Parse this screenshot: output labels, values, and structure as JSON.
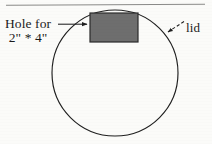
{
  "figure": {
    "background_color": "#fbfbf9",
    "ink_color": "#1b1b1b"
  },
  "top_rule": {
    "name": "horizontal-rule",
    "x1": 6,
    "y1": 5,
    "x2": 205,
    "y2": 4,
    "color": "#8a8a88"
  },
  "lid": {
    "shape": "circle",
    "label": "lid",
    "center_x": 115,
    "center_y": 73,
    "radius": 63,
    "stroke_color": "#1f1f1f",
    "stroke_width": 1.1,
    "fill": "none"
  },
  "hole": {
    "shape": "rectangle",
    "label_line_1": "Hole for",
    "label_line_2": "2\" * 4\"",
    "x": 90,
    "y": 13,
    "width": 48,
    "height": 29,
    "fill_color": "#6e6e6e",
    "stroke_color": "#2a2a2a",
    "stroke_width": 1.2
  },
  "hole_leader": {
    "name": "hole-leader-arrow",
    "x1": 58,
    "y1": 24,
    "x2": 88,
    "y2": 24,
    "color": "#1f1f1f",
    "arrowhead": "filled-triangle"
  },
  "lid_leader": {
    "name": "lid-leader-arrow",
    "x1": 183,
    "y1": 22,
    "x2": 167,
    "y2": 33,
    "color": "#1f1f1f",
    "arrowhead": "filled-triangle",
    "style": "dashed"
  }
}
